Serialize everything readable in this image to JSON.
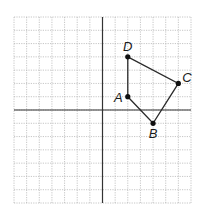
{
  "diagram": {
    "type": "coordinate-plane",
    "grid": {
      "xmin": -7,
      "xmax": 7,
      "ymin": -7,
      "ymax": 7,
      "step": 1
    },
    "colors": {
      "grid": "#b8b8b8",
      "axis": "#333333",
      "shape": "#2a2a2a",
      "point": "#111111",
      "background": "#ffffff"
    },
    "polygon": [
      "A",
      "B",
      "C",
      "D"
    ],
    "points": [
      {
        "name": "A",
        "label": "A",
        "x": 2,
        "y": 1,
        "label_pos": "left"
      },
      {
        "name": "B",
        "label": "B",
        "x": 4,
        "y": -1,
        "label_pos": "below"
      },
      {
        "name": "C",
        "label": "C",
        "x": 6,
        "y": 2,
        "label_pos": "right"
      },
      {
        "name": "D",
        "label": "D",
        "x": 2,
        "y": 4,
        "label_pos": "above"
      }
    ]
  },
  "labels": {
    "A": "A",
    "B": "B",
    "C": "C",
    "D": "D"
  }
}
